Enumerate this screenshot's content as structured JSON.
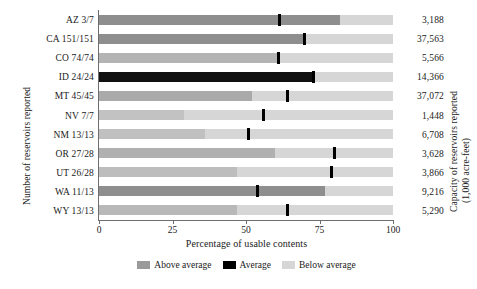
{
  "chart_data": {
    "type": "bar",
    "subtype": "stacked-horizontal-with-marker",
    "title": "",
    "xlabel": "Percentage of usable contents",
    "ylabel": "Number of reservoirs reported",
    "ylabel_right": "Capacity of reservoirs reported",
    "ylabel_right_2": "(1,000 acre-feet)",
    "xlim": [
      0,
      100
    ],
    "xticks": [
      0,
      25,
      50,
      75,
      100
    ],
    "xticklabels": [
      "0",
      "25",
      "50",
      "75",
      "100"
    ],
    "grid": false,
    "legend_position": "bottom-center",
    "categories": [
      "AZ 3/7",
      "CA 151/151",
      "CO 74/74",
      "ID 24/24",
      "MT 45/45",
      "NV 7/7",
      "NM 13/13",
      "OR 27/28",
      "UT 26/28",
      "WA 11/13",
      "WY 13/13"
    ],
    "series": [
      {
        "name": "Above average",
        "color": "#9a9a9a",
        "values": [
          82,
          70,
          61,
          73,
          52,
          29,
          36,
          60,
          47,
          77,
          47
        ]
      },
      {
        "name": "Average",
        "color": "#000000",
        "values": [
          61.5,
          70,
          61,
          73,
          64,
          56,
          51,
          80,
          79,
          54,
          64
        ]
      },
      {
        "name": "Below average",
        "color": "#d6d6d6",
        "values": [
          100,
          100,
          100,
          100,
          100,
          100,
          100,
          100,
          100,
          100,
          100
        ]
      }
    ],
    "bar_shades": [
      "#8e8e8e",
      "#8e8e8e",
      "#b4b4b4",
      "#111111",
      "#aaaaaa",
      "#c2c2c2",
      "#c0c0c0",
      "#b0b0b0",
      "#bdbdbd",
      "#8e8e8e",
      "#b8b8b8"
    ],
    "capacity_values": [
      "3,188",
      "37,563",
      "5,566",
      "14,366",
      "37,072",
      "1,448",
      "6,708",
      "3,628",
      "3,866",
      "9,216",
      "5,290"
    ],
    "legend": [
      {
        "label": "Above average",
        "color": "#9a9a9a"
      },
      {
        "label": "Average",
        "color": "#000000"
      },
      {
        "label": "Below average",
        "color": "#d6d6d6"
      }
    ]
  }
}
